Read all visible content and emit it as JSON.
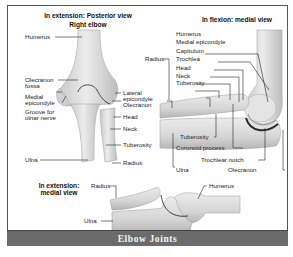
{
  "figure": {
    "caption": "Elbow Joints",
    "panels": {
      "posterior": {
        "title": "In extension: Posterior view",
        "subtitle": "Right elbow",
        "labels": {
          "humerus": "Humerus",
          "olecranon_fossa_1": "Olecranon",
          "olecranon_fossa_2": "fossa",
          "medial_epicondyle_1": "Medial",
          "medial_epicondyle_2": "epicondyle",
          "groove_1": "Groove for",
          "groove_2": "ulnar nerve",
          "ulna": "Ulna",
          "lateral_epicondyle_1": "Lateral",
          "lateral_epicondyle_2": "epicondyle",
          "olecranon": "Olecranon",
          "head": "Head",
          "neck": "Neck",
          "tuberosity": "Tuberosity",
          "radius": "Radius"
        }
      },
      "flexion": {
        "title": "In flexion: medial  view",
        "labels": {
          "humerus": "Humerus",
          "medial_epicondyle": "Medial epicondyle",
          "capitulum": "Capitulum",
          "trochlea": "Trochlea",
          "head": "Head",
          "neck": "Neck",
          "tuberosity_top": "Tuberosity",
          "radius": "Radius",
          "tuberosity_bottom": "Tuberosity",
          "coronoid_process": "Coronoid process",
          "trochlear_notch": "Trochlear notch",
          "ulna": "Ulna",
          "olecranon": "Olecranon"
        }
      },
      "extension_medial": {
        "title_1": "In extension:",
        "title_2": "medial view",
        "labels": {
          "radius": "Radius",
          "ulna": "Ulna",
          "humerus": "Humerus"
        }
      }
    },
    "colors": {
      "bone_fill": "#e2e2e2",
      "bone_shadow": "#b8b8b8",
      "outline": "#333333",
      "footer_bg": "#6b6b6b",
      "footer_text": "#f4f4f4",
      "frame_border": "#555555"
    }
  }
}
